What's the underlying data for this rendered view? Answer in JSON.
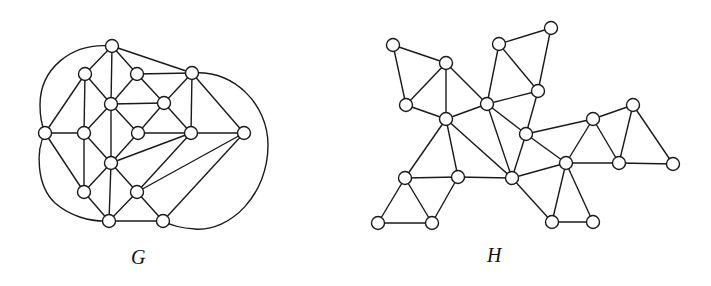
{
  "figure": {
    "width": 711,
    "height": 286,
    "node_radius": 6.5,
    "stroke_color": "#1a1a1a",
    "fill_color": "#ffffff"
  },
  "graphs": [
    {
      "name": "G",
      "label": "G",
      "label_pos": [
        131,
        247
      ],
      "nodes": [
        [
          112,
          46
        ],
        [
          85,
          74
        ],
        [
          137,
          74
        ],
        [
          111,
          104
        ],
        [
          164,
          103
        ],
        [
          45,
          133
        ],
        [
          84,
          133
        ],
        [
          138,
          133
        ],
        [
          111,
          163
        ],
        [
          84,
          192
        ],
        [
          137,
          192
        ],
        [
          109,
          221
        ],
        [
          163,
          221
        ],
        [
          192,
          73
        ],
        [
          191,
          133
        ],
        [
          244,
          133
        ]
      ],
      "edges": [
        [
          0,
          1
        ],
        [
          0,
          2
        ],
        [
          0,
          3
        ],
        [
          0,
          13
        ],
        [
          1,
          3
        ],
        [
          1,
          5
        ],
        [
          1,
          6
        ],
        [
          2,
          3
        ],
        [
          2,
          4
        ],
        [
          2,
          13
        ],
        [
          3,
          4
        ],
        [
          3,
          6
        ],
        [
          3,
          7
        ],
        [
          3,
          8
        ],
        [
          4,
          7
        ],
        [
          4,
          13
        ],
        [
          4,
          14
        ],
        [
          5,
          6
        ],
        [
          5,
          9
        ],
        [
          6,
          8
        ],
        [
          6,
          9
        ],
        [
          7,
          8
        ],
        [
          7,
          14
        ],
        [
          8,
          9
        ],
        [
          8,
          10
        ],
        [
          8,
          11
        ],
        [
          8,
          14
        ],
        [
          9,
          11
        ],
        [
          10,
          11
        ],
        [
          10,
          12
        ],
        [
          10,
          14
        ],
        [
          10,
          15
        ],
        [
          11,
          12
        ],
        [
          12,
          15
        ],
        [
          13,
          14
        ],
        [
          13,
          15
        ],
        [
          14,
          15
        ]
      ],
      "arcs": [
        {
          "from": 0,
          "to": 5,
          "path": "M112,46 C70,42 40,70 40,105 C40,118 42,126 45,133"
        },
        {
          "from": 5,
          "to": 11,
          "path": "M45,133 C36,150 36,185 55,203 C70,216 90,222 109,221"
        },
        {
          "from": 13,
          "to": 12,
          "path": "M192,73 C235,70 268,105 268,145 C268,195 230,232 195,229 C180,228 170,225 163,221"
        }
      ]
    },
    {
      "name": "H",
      "label": "H",
      "label_pos": [
        487,
        245
      ],
      "nodes": [
        [
          393,
          45
        ],
        [
          446,
          63
        ],
        [
          406,
          105
        ],
        [
          446,
          119
        ],
        [
          487,
          104
        ],
        [
          499,
          44
        ],
        [
          551,
          28
        ],
        [
          538,
          91
        ],
        [
          526,
          134
        ],
        [
          593,
          119
        ],
        [
          633,
          105
        ],
        [
          566,
          163
        ],
        [
          619,
          163
        ],
        [
          673,
          164
        ],
        [
          512,
          178
        ],
        [
          405,
          178
        ],
        [
          458,
          177
        ],
        [
          378,
          223
        ],
        [
          432,
          223
        ],
        [
          552,
          222
        ],
        [
          593,
          222
        ]
      ],
      "edges": [
        [
          0,
          1
        ],
        [
          0,
          2
        ],
        [
          1,
          2
        ],
        [
          1,
          3
        ],
        [
          1,
          4
        ],
        [
          2,
          3
        ],
        [
          3,
          4
        ],
        [
          3,
          14
        ],
        [
          3,
          15
        ],
        [
          3,
          16
        ],
        [
          4,
          5
        ],
        [
          4,
          7
        ],
        [
          4,
          14
        ],
        [
          4,
          8
        ],
        [
          5,
          6
        ],
        [
          5,
          7
        ],
        [
          6,
          7
        ],
        [
          7,
          8
        ],
        [
          8,
          9
        ],
        [
          8,
          11
        ],
        [
          8,
          14
        ],
        [
          9,
          10
        ],
        [
          9,
          11
        ],
        [
          9,
          12
        ],
        [
          10,
          12
        ],
        [
          10,
          13
        ],
        [
          11,
          12
        ],
        [
          11,
          14
        ],
        [
          11,
          19
        ],
        [
          11,
          20
        ],
        [
          12,
          13
        ],
        [
          14,
          16
        ],
        [
          14,
          19
        ],
        [
          15,
          16
        ],
        [
          15,
          17
        ],
        [
          15,
          18
        ],
        [
          16,
          18
        ],
        [
          17,
          18
        ],
        [
          19,
          20
        ]
      ],
      "arcs": []
    }
  ]
}
